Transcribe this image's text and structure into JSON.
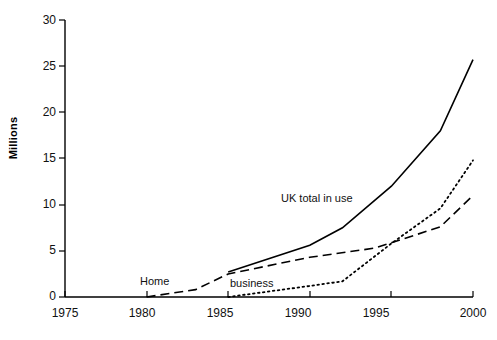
{
  "chart_data": {
    "type": "line",
    "title": "",
    "subtitle": "",
    "xlabel": "",
    "ylabel": "Millions",
    "xlim": [
      1975,
      2000
    ],
    "ylim": [
      0,
      30
    ],
    "x_ticks": [
      1975,
      1980,
      1985,
      1990,
      1995,
      2000
    ],
    "y_ticks": [
      0,
      5,
      10,
      15,
      20,
      25,
      30
    ],
    "grid": false,
    "legend": "inline-annotations",
    "series": [
      {
        "name": "UK total in use",
        "style": "solid",
        "color": "#000000",
        "label_position": {
          "x": 1990.0,
          "y": 9.2
        },
        "x": [
          1985,
          1990,
          1992,
          1995,
          1998,
          2000
        ],
        "values": [
          2.7,
          5.6,
          7.5,
          12.0,
          18.0,
          25.7
        ]
      },
      {
        "name": "Home",
        "style": "dashed",
        "color": "#000000",
        "label_position": {
          "x": 1980.6,
          "y": 1.6
        },
        "x": [
          1980,
          1983,
          1985,
          1990,
          1994,
          1998,
          2000
        ],
        "values": [
          0.0,
          0.8,
          2.5,
          4.3,
          5.3,
          7.6,
          11.0
        ]
      },
      {
        "name": "business",
        "style": "dotted",
        "color": "#000000",
        "label_position": {
          "x": 1987.6,
          "y": 1.3
        },
        "x": [
          1985,
          1990,
          1992,
          1995,
          1998,
          2000
        ],
        "values": [
          0.0,
          1.2,
          1.7,
          5.8,
          9.6,
          14.8
        ]
      }
    ]
  },
  "axis": {
    "y_title": "Millions",
    "y_tick_labels": [
      "0",
      "5",
      "10",
      "15",
      "20",
      "25",
      "30"
    ],
    "x_tick_labels": [
      "1975",
      "1980",
      "1985",
      "1990",
      "1995",
      "2000"
    ]
  },
  "annotations": {
    "total_label": "UK total in use",
    "home_label": "Home",
    "business_label": "business"
  }
}
